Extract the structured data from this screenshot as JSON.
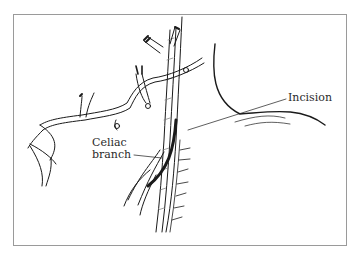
{
  "figure": {
    "type": "anatomical line illustration",
    "frame_color": "#9a9a9a",
    "ink_color": "#1a1a1a"
  },
  "labels": {
    "incision": "Incision",
    "celiac_line1": "Celiac",
    "celiac_line2": "branch"
  }
}
